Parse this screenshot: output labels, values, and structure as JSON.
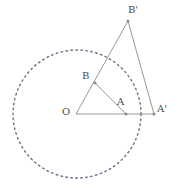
{
  "figure": {
    "width": 177,
    "height": 190,
    "background_color": "#ffffff",
    "stroke_color": "#8c8c8c",
    "label_color": "#4a4a4a",
    "dash_color": "#6e6e8c"
  },
  "circle": {
    "name": "dashed-circle",
    "center_label": "O",
    "cx": 77,
    "cy": 114,
    "r": 64,
    "style": "dashed",
    "dash_pattern": "1.6 3.4",
    "stroke_width": 1.4
  },
  "points": [
    {
      "id": "O",
      "label": "O",
      "x": 76,
      "y": 114,
      "label_x": 62,
      "label_y": 107,
      "marker": false
    },
    {
      "id": "A",
      "label": "A",
      "x": 126,
      "y": 114,
      "label_x": 117,
      "label_y": 97,
      "marker": true
    },
    {
      "id": "Ap",
      "label": "A'",
      "x": 154,
      "y": 114,
      "label_x": 157,
      "label_y": 104,
      "marker": true
    },
    {
      "id": "B",
      "label": "B",
      "x": 95,
      "y": 83,
      "label_x": 82,
      "label_y": 71,
      "marker": true
    },
    {
      "id": "Bp",
      "label": "B'",
      "x": 128,
      "y": 21,
      "label_x": 128,
      "label_y": 5,
      "marker": true
    }
  ],
  "segments": [
    {
      "name": "segment-O-Ap",
      "from": "O",
      "to": "Ap",
      "x1": 76,
      "y1": 114,
      "x2": 154,
      "y2": 114
    },
    {
      "name": "segment-O-Bp",
      "from": "O",
      "to": "Bp",
      "x1": 76,
      "y1": 114,
      "x2": 128,
      "y2": 21
    },
    {
      "name": "segment-Bp-Ap",
      "from": "Bp",
      "to": "Ap",
      "x1": 128,
      "y1": 21,
      "x2": 154,
      "y2": 114
    },
    {
      "name": "segment-B-A",
      "from": "B",
      "to": "A",
      "x1": 95,
      "y1": 83,
      "x2": 126,
      "y2": 114
    }
  ],
  "labels": {
    "O": "O",
    "A": "A",
    "A_prime": "A'",
    "B": "B",
    "B_prime": "B'"
  }
}
